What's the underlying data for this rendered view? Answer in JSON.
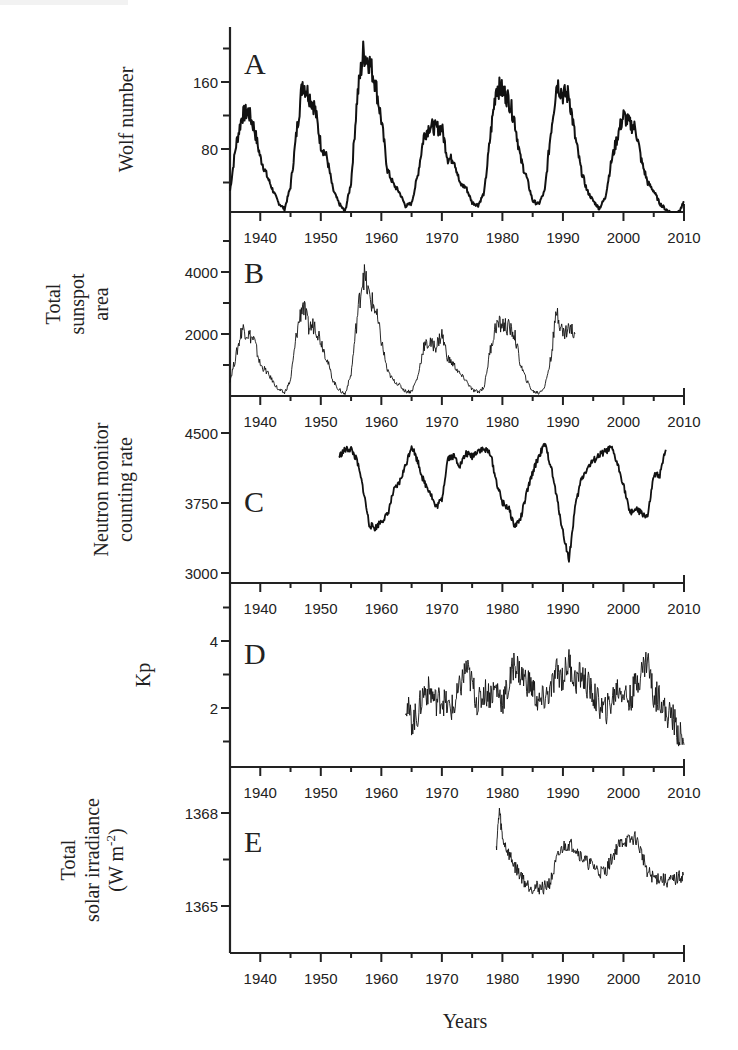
{
  "figure": {
    "x_axis_title": "Years",
    "x_ticks": [
      1940,
      1950,
      1960,
      1970,
      1980,
      1990,
      2000,
      2010
    ],
    "x_range": [
      1935,
      2010
    ]
  },
  "panels": [
    {
      "letter": "A",
      "ylabel_lines": [
        "Wolf number"
      ],
      "yticks": [
        {
          "v": 80,
          "label": "80"
        },
        {
          "v": 160,
          "label": "160"
        }
      ]
    },
    {
      "letter": "B",
      "ylabel_lines": [
        "Total",
        "sunspot",
        "area"
      ],
      "yticks": [
        {
          "v": 2000,
          "label": "2000"
        },
        {
          "v": 4000,
          "label": "4000"
        }
      ]
    },
    {
      "letter": "C",
      "ylabel_lines": [
        "Neutron monitor",
        "counting rate"
      ],
      "yticks": [
        {
          "v": 3000,
          "label": "3000"
        },
        {
          "v": 3750,
          "label": "3750"
        },
        {
          "v": 4500,
          "label": "4500"
        }
      ]
    },
    {
      "letter": "D",
      "ylabel_lines": [
        "Kp"
      ],
      "yticks": [
        {
          "v": 2,
          "label": "2"
        },
        {
          "v": 4,
          "label": "4"
        }
      ]
    },
    {
      "letter": "E",
      "ylabel_lines": [
        "Total",
        "solar irradiance",
        "(W m-2)"
      ],
      "yticks": [
        {
          "v": 1365,
          "label": "1365"
        },
        {
          "v": 1368,
          "label": "1368"
        }
      ]
    }
  ],
  "chart_data": [
    {
      "type": "line",
      "title": "A",
      "xlabel": "Years",
      "ylabel": "Wolf number",
      "xlim": [
        1935,
        2010
      ],
      "ylim": [
        0,
        210
      ],
      "grid": false,
      "yticks": [
        80,
        160
      ],
      "xticks": [
        1940,
        1950,
        1960,
        1970,
        1980,
        1990,
        2000,
        2010
      ],
      "x": [
        1935,
        1936,
        1937,
        1938,
        1939,
        1940,
        1941,
        1942,
        1943,
        1944,
        1945,
        1946,
        1947,
        1948,
        1949,
        1950,
        1951,
        1952,
        1953,
        1954,
        1955,
        1956,
        1957,
        1958,
        1959,
        1960,
        1961,
        1962,
        1963,
        1964,
        1965,
        1966,
        1967,
        1968,
        1969,
        1970,
        1971,
        1972,
        1973,
        1974,
        1975,
        1976,
        1977,
        1978,
        1979,
        1980,
        1981,
        1982,
        1983,
        1984,
        1985,
        1986,
        1987,
        1988,
        1989,
        1990,
        1991,
        1992,
        1993,
        1994,
        1995,
        1996,
        1997,
        1998,
        1999,
        2000,
        2001,
        2002,
        2003,
        2004,
        2005,
        2006,
        2007,
        2008,
        2009,
        2010
      ],
      "values": [
        30,
        85,
        120,
        125,
        105,
        70,
        50,
        32,
        16,
        8,
        35,
        100,
        160,
        145,
        130,
        85,
        70,
        32,
        15,
        5,
        40,
        140,
        195,
        185,
        160,
        115,
        55,
        38,
        28,
        12,
        15,
        48,
        95,
        108,
        105,
        105,
        68,
        68,
        38,
        34,
        16,
        13,
        28,
        95,
        155,
        150,
        140,
        115,
        68,
        46,
        18,
        14,
        30,
        100,
        160,
        145,
        145,
        95,
        55,
        30,
        18,
        9,
        22,
        65,
        95,
        120,
        110,
        105,
        65,
        40,
        30,
        15,
        8,
        3,
        3,
        16
      ]
    },
    {
      "type": "line",
      "title": "B",
      "xlabel": "Years",
      "ylabel": "Total sunspot area",
      "xlim": [
        1935,
        2010
      ],
      "ylim": [
        0,
        4600
      ],
      "grid": false,
      "yticks": [
        2000,
        4000
      ],
      "x": [
        1935,
        1936,
        1937,
        1938,
        1939,
        1940,
        1941,
        1942,
        1943,
        1944,
        1945,
        1946,
        1947,
        1948,
        1949,
        1950,
        1951,
        1952,
        1953,
        1954,
        1955,
        1956,
        1957,
        1958,
        1959,
        1960,
        1961,
        1962,
        1963,
        1964,
        1965,
        1966,
        1967,
        1968,
        1969,
        1970,
        1971,
        1972,
        1973,
        1974,
        1975,
        1976,
        1977,
        1978,
        1979,
        1980,
        1981,
        1982,
        1983,
        1984,
        1985,
        1986,
        1987,
        1988,
        1989,
        1990,
        1991,
        1992
      ],
      "values": [
        500,
        1300,
        2200,
        2000,
        1800,
        1000,
        800,
        500,
        200,
        100,
        500,
        2000,
        3000,
        2200,
        2300,
        1800,
        1200,
        500,
        200,
        60,
        700,
        2500,
        4000,
        3200,
        2800,
        1800,
        800,
        500,
        350,
        150,
        150,
        600,
        1600,
        1700,
        1600,
        2000,
        1200,
        1000,
        700,
        500,
        200,
        120,
        300,
        1500,
        2300,
        2300,
        2200,
        2000,
        1000,
        500,
        150,
        100,
        300,
        1200,
        2800,
        2000,
        2200,
        2000
      ]
    },
    {
      "type": "line",
      "title": "C",
      "xlabel": "Years",
      "ylabel": "Neutron monitor counting rate",
      "xlim": [
        1935,
        2010
      ],
      "ylim": [
        2920,
        4660
      ],
      "grid": false,
      "yticks": [
        3000,
        3750,
        4500
      ],
      "x": [
        1953,
        1954,
        1955,
        1956,
        1957,
        1958,
        1959,
        1960,
        1961,
        1962,
        1963,
        1964,
        1965,
        1966,
        1967,
        1968,
        1969,
        1970,
        1971,
        1972,
        1973,
        1974,
        1975,
        1976,
        1977,
        1978,
        1979,
        1980,
        1981,
        1982,
        1983,
        1984,
        1985,
        1986,
        1987,
        1988,
        1989,
        1990,
        1991,
        1992,
        1993,
        1994,
        1995,
        1996,
        1997,
        1998,
        1999,
        2000,
        2001,
        2002,
        2003,
        2004,
        2005,
        2006,
        2007
      ],
      "values": [
        4250,
        4320,
        4330,
        4200,
        3900,
        3520,
        3480,
        3560,
        3620,
        3870,
        3970,
        4150,
        4370,
        4200,
        3980,
        3880,
        3700,
        3790,
        4240,
        4250,
        4150,
        4280,
        4250,
        4320,
        4320,
        4290,
        3980,
        3750,
        3700,
        3500,
        3580,
        3850,
        4080,
        4250,
        4380,
        4150,
        3800,
        3440,
        3140,
        3700,
        4000,
        4120,
        4200,
        4260,
        4300,
        4340,
        4170,
        3950,
        3650,
        3680,
        3640,
        3600,
        4040,
        4050,
        4320
      ]
    },
    {
      "type": "line",
      "title": "D",
      "xlabel": "Years",
      "ylabel": "Kp",
      "xlim": [
        1935,
        2010
      ],
      "ylim": [
        0,
        4.9
      ],
      "grid": false,
      "yticks": [
        2,
        4
      ],
      "x": [
        1964,
        1965,
        1966,
        1967,
        1968,
        1969,
        1970,
        1971,
        1972,
        1973,
        1974,
        1975,
        1976,
        1977,
        1978,
        1979,
        1980,
        1981,
        1982,
        1983,
        1984,
        1985,
        1986,
        1987,
        1988,
        1989,
        1990,
        1991,
        1992,
        1993,
        1994,
        1995,
        1996,
        1997,
        1998,
        1999,
        2000,
        2001,
        2002,
        2003,
        2004,
        2005,
        2006,
        2007,
        2008,
        2009,
        2010
      ],
      "values": [
        2.2,
        1.6,
        1.8,
        2.5,
        2.5,
        2.2,
        2.3,
        2.0,
        2.0,
        2.6,
        3.2,
        2.7,
        2.1,
        2.5,
        2.4,
        2.6,
        2.2,
        2.6,
        3.4,
        3.0,
        2.8,
        2.6,
        2.1,
        2.3,
        2.5,
        3.1,
        2.9,
        3.4,
        2.8,
        3.0,
        2.7,
        2.4,
        2.1,
        1.9,
        2.2,
        2.6,
        2.5,
        2.2,
        2.7,
        3.1,
        3.5,
        2.3,
        2.4,
        1.8,
        1.8,
        1.3,
        0.9
      ]
    },
    {
      "type": "line",
      "title": "E",
      "xlabel": "Years",
      "ylabel": "Total solar irradiance (W m-2)",
      "xlim": [
        1935,
        2010
      ],
      "ylim": [
        1363.5,
        1369.5
      ],
      "grid": false,
      "yticks": [
        1365,
        1368
      ],
      "x": [
        1979,
        1979.5,
        1980,
        1981,
        1982,
        1983,
        1984,
        1985,
        1986,
        1987,
        1988,
        1989,
        1990,
        1991,
        1992,
        1993,
        1994,
        1995,
        1996,
        1997,
        1998,
        1999,
        2000,
        2001,
        2002,
        2003,
        2004,
        2005,
        2006,
        2007,
        2008,
        2009,
        2010
      ],
      "values": [
        1366.9,
        1368.1,
        1367.2,
        1366.7,
        1366.3,
        1366.0,
        1365.7,
        1365.6,
        1365.6,
        1365.6,
        1365.8,
        1366.5,
        1366.9,
        1367.0,
        1366.9,
        1366.6,
        1366.4,
        1366.3,
        1366.1,
        1366.1,
        1366.5,
        1366.9,
        1367.1,
        1367.1,
        1367.2,
        1366.7,
        1366.1,
        1365.9,
        1365.9,
        1365.8,
        1365.8,
        1365.9,
        1366.0
      ]
    }
  ]
}
